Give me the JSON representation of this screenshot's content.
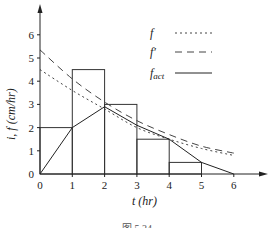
{
  "chart_data": {
    "type": "line",
    "title": "",
    "xlabel": "t (hr)",
    "ylabel": "i, f (cm/hr)",
    "xlim": [
      0,
      7
    ],
    "ylim": [
      0,
      7
    ],
    "x_ticks": [
      "0",
      "1",
      "2",
      "3",
      "4",
      "5",
      "6"
    ],
    "y_ticks": [
      "0",
      "1",
      "2",
      "3",
      "4",
      "5",
      "6"
    ],
    "grid": false,
    "legend_position": "upper right",
    "bars": {
      "name": "i (rainfall intensity)",
      "type": "bar",
      "intervals": [
        [
          0,
          1
        ],
        [
          1,
          2
        ],
        [
          2,
          3
        ],
        [
          3,
          4
        ],
        [
          4,
          5
        ]
      ],
      "values": [
        2.0,
        4.5,
        3.0,
        1.5,
        0.5
      ]
    },
    "series": [
      {
        "name": "f",
        "style": "dotted",
        "x": [
          0,
          1,
          2,
          3,
          4,
          5,
          6
        ],
        "values": [
          4.5,
          3.6,
          2.8,
          2.0,
          1.5,
          1.1,
          0.8
        ]
      },
      {
        "name": "f'",
        "style": "dashed",
        "x": [
          0,
          1,
          2,
          3,
          4,
          5,
          6
        ],
        "values": [
          5.35,
          4.1,
          3.1,
          2.3,
          1.7,
          1.2,
          0.9
        ]
      },
      {
        "name": "f_act",
        "style": "solid",
        "x": [
          0,
          1,
          2,
          3,
          4,
          5,
          6
        ],
        "values": [
          0,
          2.0,
          2.9,
          2.1,
          1.5,
          0.5,
          0
        ]
      }
    ],
    "caption": "图 5.24"
  },
  "labels": {
    "xlabel": "t (hr)",
    "ylabel": "i, f (cm/hr)",
    "legend_f": "f",
    "legend_fprime": "f′",
    "legend_fact_main": "f",
    "legend_fact_sub": "act",
    "caption": "图 5.24"
  }
}
